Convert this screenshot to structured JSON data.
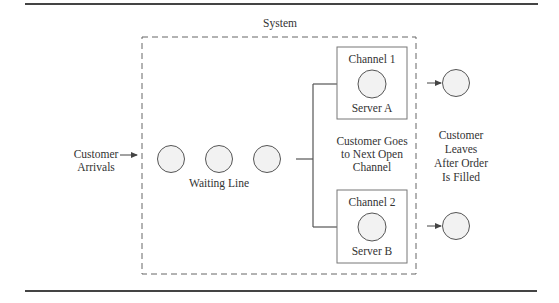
{
  "diagram": {
    "title": "System",
    "arrivals": {
      "line1": "Customer",
      "line2": "Arrivals"
    },
    "waiting_line": {
      "label": "Waiting Line",
      "customers": 3
    },
    "routing_label": {
      "line1": "Customer Goes",
      "line2": "to Next Open",
      "line3": "Channel"
    },
    "channels": [
      {
        "name": "Channel 1",
        "server": "Server A"
      },
      {
        "name": "Channel 2",
        "server": "Server B"
      }
    ],
    "exit_label": {
      "line1": "Customer",
      "line2": "Leaves",
      "line3": "After Order",
      "line4": "Is Filled"
    },
    "colors": {
      "stroke": "#555555",
      "rule": "#444444",
      "circle_fill": "#f2f2f2",
      "text": "#333333"
    }
  }
}
